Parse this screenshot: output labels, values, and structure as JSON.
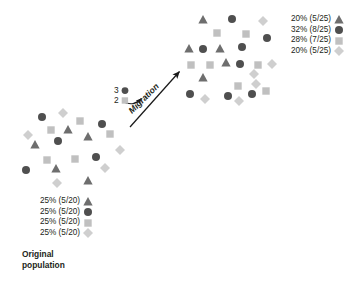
{
  "diagram": {
    "title_caption": "Original\npopulation",
    "caption_line1": "Original",
    "caption_line2": "population"
  },
  "colors": {
    "triangle": "#6e6e6e",
    "circle": "#4f4f4f",
    "square": "#c0c0c0",
    "diamond": "#cfcfcf",
    "text": "#231f20",
    "arrow": "#1a1a1a",
    "background": "#ffffff"
  },
  "legend_left": {
    "rows": [
      {
        "text": "25% (5/20)",
        "symbol": "triangle-icon"
      },
      {
        "text": "25% (5/20)",
        "symbol": "circle-icon"
      },
      {
        "text": "25% (5/20)",
        "symbol": "square-icon"
      },
      {
        "text": "25% (5/20)",
        "symbol": "diamond-icon"
      }
    ]
  },
  "legend_right": {
    "rows": [
      {
        "text": "20% (5/25)",
        "symbol": "triangle-icon"
      },
      {
        "text": "32% (8/25)",
        "symbol": "circle-icon"
      },
      {
        "text": "28% (7/25)",
        "symbol": "square-icon"
      },
      {
        "text": "20% (5/25)",
        "symbol": "diamond-icon"
      }
    ]
  },
  "migration": {
    "label": "Migration",
    "counts": [
      {
        "value": "3",
        "symbol": "circle-icon"
      },
      {
        "value": "2",
        "symbol": "square-icon"
      }
    ]
  },
  "chart_data": {
    "type": "scatter",
    "title": "",
    "xlabel": "",
    "ylabel": "",
    "legend_position": "right-of-each-cluster",
    "grid": false,
    "symbol_categories": [
      "triangle",
      "circle",
      "square",
      "diamond"
    ],
    "clusters": [
      {
        "name": "Original population",
        "total": 20,
        "composition": {
          "triangle": {
            "count": 5,
            "of": 20,
            "percent": 25
          },
          "circle": {
            "count": 5,
            "of": 20,
            "percent": 25
          },
          "square": {
            "count": 5,
            "of": 20,
            "percent": 25
          },
          "diamond": {
            "count": 5,
            "of": 20,
            "percent": 25
          }
        },
        "points": [
          {
            "x": 42,
            "y": 117,
            "s": "circle"
          },
          {
            "x": 63,
            "y": 113,
            "s": "diamond"
          },
          {
            "x": 80,
            "y": 121,
            "s": "square"
          },
          {
            "x": 102,
            "y": 124,
            "s": "circle"
          },
          {
            "x": 28,
            "y": 135,
            "s": "diamond"
          },
          {
            "x": 51,
            "y": 130,
            "s": "square"
          },
          {
            "x": 68,
            "y": 130,
            "s": "triangle"
          },
          {
            "x": 88,
            "y": 137,
            "s": "triangle"
          },
          {
            "x": 110,
            "y": 134,
            "s": "square"
          },
          {
            "x": 35,
            "y": 145,
            "s": "triangle"
          },
          {
            "x": 58,
            "y": 141,
            "s": "circle"
          },
          {
            "x": 120,
            "y": 150,
            "s": "diamond"
          },
          {
            "x": 47,
            "y": 160,
            "s": "square"
          },
          {
            "x": 75,
            "y": 159,
            "s": "square"
          },
          {
            "x": 96,
            "y": 157,
            "s": "circle"
          },
          {
            "x": 26,
            "y": 170,
            "s": "circle"
          },
          {
            "x": 56,
            "y": 169,
            "s": "triangle"
          },
          {
            "x": 105,
            "y": 168,
            "s": "diamond"
          },
          {
            "x": 57,
            "y": 183,
            "s": "diamond"
          },
          {
            "x": 88,
            "y": 181,
            "s": "triangle"
          }
        ]
      },
      {
        "name": "Post-migration population",
        "total": 25,
        "composition": {
          "triangle": {
            "count": 5,
            "of": 25,
            "percent": 20
          },
          "circle": {
            "count": 8,
            "of": 25,
            "percent": 32
          },
          "square": {
            "count": 7,
            "of": 25,
            "percent": 28
          },
          "diamond": {
            "count": 5,
            "of": 25,
            "percent": 20
          }
        },
        "points": [
          {
            "x": 203,
            "y": 20,
            "s": "triangle"
          },
          {
            "x": 232,
            "y": 19,
            "s": "circle"
          },
          {
            "x": 263,
            "y": 21,
            "s": "diamond"
          },
          {
            "x": 217,
            "y": 33,
            "s": "square"
          },
          {
            "x": 246,
            "y": 34,
            "s": "square"
          },
          {
            "x": 267,
            "y": 38,
            "s": "circle"
          },
          {
            "x": 189,
            "y": 49,
            "s": "triangle"
          },
          {
            "x": 203,
            "y": 49,
            "s": "circle"
          },
          {
            "x": 220,
            "y": 49,
            "s": "triangle"
          },
          {
            "x": 242,
            "y": 47,
            "s": "circle"
          },
          {
            "x": 191,
            "y": 65,
            "s": "square"
          },
          {
            "x": 210,
            "y": 65,
            "s": "square"
          },
          {
            "x": 226,
            "y": 63,
            "s": "triangle"
          },
          {
            "x": 240,
            "y": 64,
            "s": "circle"
          },
          {
            "x": 258,
            "y": 65,
            "s": "square"
          },
          {
            "x": 272,
            "y": 64,
            "s": "diamond"
          },
          {
            "x": 254,
            "y": 74,
            "s": "diamond"
          },
          {
            "x": 203,
            "y": 78,
            "s": "triangle"
          },
          {
            "x": 238,
            "y": 86,
            "s": "square"
          },
          {
            "x": 256,
            "y": 84,
            "s": "diamond"
          },
          {
            "x": 190,
            "y": 94,
            "s": "circle"
          },
          {
            "x": 205,
            "y": 99,
            "s": "diamond"
          },
          {
            "x": 228,
            "y": 96,
            "s": "circle"
          },
          {
            "x": 239,
            "y": 101,
            "s": "diamond"
          },
          {
            "x": 252,
            "y": 94,
            "s": "circle"
          },
          {
            "x": 266,
            "y": 91,
            "s": "square"
          }
        ]
      }
    ],
    "migration_flow": {
      "label": "Migration",
      "moved": [
        {
          "count": 3,
          "symbol": "circle"
        },
        {
          "count": 2,
          "symbol": "square"
        }
      ],
      "arrow_from": [
        130,
        127
      ],
      "arrow_to": [
        181,
        70
      ]
    }
  }
}
